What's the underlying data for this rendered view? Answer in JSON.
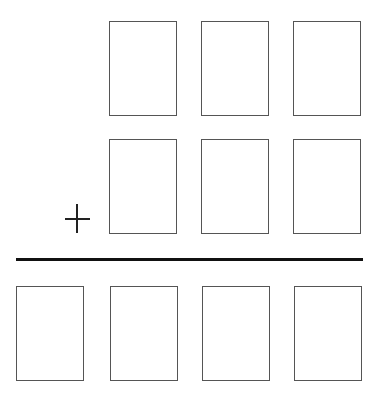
{
  "diagram": {
    "type": "column-addition",
    "operator": "+",
    "rows": [
      {
        "name": "addend-1",
        "boxes": 3,
        "x": [
          109,
          201,
          293
        ],
        "y": 21
      },
      {
        "name": "addend-2",
        "boxes": 3,
        "x": [
          109,
          201,
          293
        ],
        "y": 139
      },
      {
        "name": "sum",
        "boxes": 4,
        "x": [
          16,
          110,
          202,
          294
        ],
        "y": 286
      }
    ],
    "box": {
      "width": 69,
      "height": 96,
      "border_color": "#555555"
    },
    "line_color": "#111111"
  }
}
